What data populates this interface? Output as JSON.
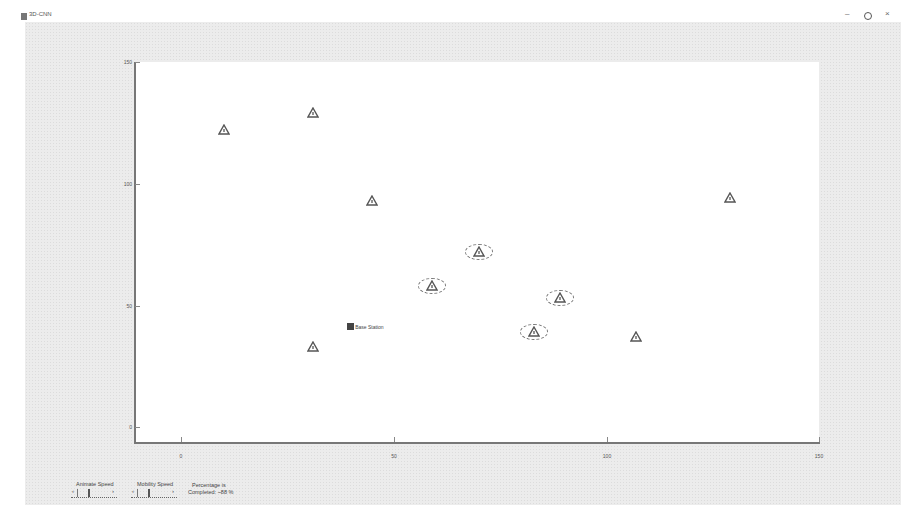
{
  "window": {
    "title": "3D-CNN",
    "controls": {
      "minimize": "–",
      "maximize": "○",
      "close": "×"
    }
  },
  "plot": {
    "y_ticks": [
      {
        "label": "150",
        "top": 62
      },
      {
        "label": "100",
        "top": 184
      },
      {
        "label": "50",
        "top": 306
      },
      {
        "label": "0",
        "top": 427
      }
    ],
    "x_ticks": [
      {
        "label": "0",
        "left": 181
      },
      {
        "label": "50",
        "left": 394
      },
      {
        "label": "100",
        "left": 607
      },
      {
        "label": "150",
        "left": 819
      }
    ],
    "base_station_label": "Base Station"
  },
  "controls": {
    "animate_speed_label": "Animate Speed",
    "mobility_speed_label": "Mobility Speed",
    "percentage_line1": "Percentage is",
    "percentage_line2": "Completed: ~88 %"
  },
  "chart_data": {
    "type": "scatter",
    "title": "",
    "xlabel": "",
    "ylabel": "",
    "xlim": [
      0,
      150
    ],
    "ylim": [
      0,
      150
    ],
    "grid": false,
    "series": [
      {
        "name": "Sensor Nodes",
        "marker": "triangle",
        "points": [
          {
            "x": 10,
            "y": 122,
            "highlighted": false
          },
          {
            "x": 31,
            "y": 129,
            "highlighted": false
          },
          {
            "x": 45,
            "y": 93,
            "highlighted": false
          },
          {
            "x": 129,
            "y": 94,
            "highlighted": false
          },
          {
            "x": 70,
            "y": 72,
            "highlighted": true
          },
          {
            "x": 59,
            "y": 58,
            "highlighted": true
          },
          {
            "x": 89,
            "y": 53,
            "highlighted": true
          },
          {
            "x": 83,
            "y": 39,
            "highlighted": true
          },
          {
            "x": 31,
            "y": 33,
            "highlighted": false
          },
          {
            "x": 107,
            "y": 37,
            "highlighted": false
          }
        ]
      },
      {
        "name": "Base Station",
        "marker": "square",
        "points": [
          {
            "x": 40,
            "y": 41
          }
        ]
      }
    ]
  }
}
